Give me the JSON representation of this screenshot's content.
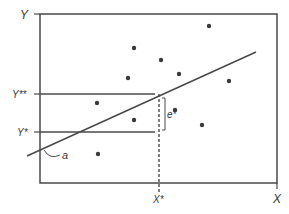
{
  "diagram": {
    "type": "regression-scatter",
    "axes": {
      "y_label": "Y",
      "x_label": "X",
      "y_star_label": "Y*",
      "y_double_star_label": "Y**",
      "x_star_label": "X*"
    },
    "annotations": {
      "intercept_label": "a",
      "error_label": "e*"
    },
    "points": [
      {
        "x": 209,
        "y": 26
      },
      {
        "x": 134,
        "y": 48
      },
      {
        "x": 161,
        "y": 60
      },
      {
        "x": 179,
        "y": 74
      },
      {
        "x": 128,
        "y": 78
      },
      {
        "x": 229,
        "y": 81
      },
      {
        "x": 97,
        "y": 103
      },
      {
        "x": 175,
        "y": 110
      },
      {
        "x": 134,
        "y": 120
      },
      {
        "x": 202,
        "y": 125
      },
      {
        "x": 98,
        "y": 154
      }
    ],
    "colors": {
      "line": "#4a4a4a",
      "point": "#3a3a3a",
      "text": "#3a3a3a"
    }
  }
}
